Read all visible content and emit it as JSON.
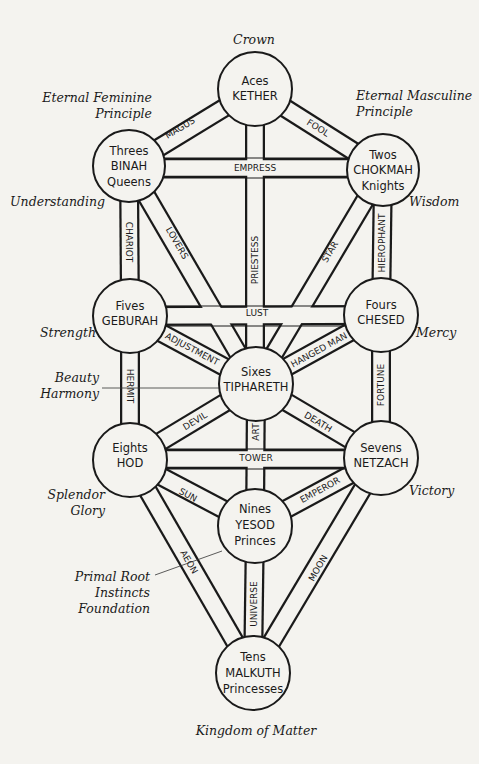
{
  "title_top": "Crown",
  "title_bottom": "Kingdom of Matter",
  "sephiroth": {
    "kether": {
      "line1": "Aces",
      "line2": "KETHER"
    },
    "chokmah": {
      "line1": "Twos",
      "line2": "CHOKMAH",
      "line3": "Knights"
    },
    "binah": {
      "line1": "Threes",
      "line2": "BINAH",
      "line3": "Queens"
    },
    "chesed": {
      "line1": "Fours",
      "line2": "CHESED"
    },
    "geburah": {
      "line1": "Fives",
      "line2": "GEBURAH"
    },
    "tiphareth": {
      "line1": "Sixes",
      "line2": "TIPHARETH"
    },
    "netzach": {
      "line1": "Sevens",
      "line2": "NETZACH"
    },
    "hod": {
      "line1": "Eights",
      "line2": "HOD"
    },
    "yesod": {
      "line1": "Nines",
      "line2": "YESOD",
      "line3": "Princes"
    },
    "malkuth": {
      "line1": "Tens",
      "line2": "MALKUTH",
      "line3": "Princesses"
    }
  },
  "paths": {
    "magus": "MAGUS",
    "fool": "FOOL",
    "empress": "EMPRESS",
    "priestess": "PRIESTESS",
    "chariot": "CHARIOT",
    "lovers": "LOVERS",
    "star": "STAR",
    "hierophant": "HIEROPHANT",
    "lust": "LUST",
    "adjustment": "ADJUSTMENT",
    "hanged_man": "HANGED MAN",
    "hermit": "HERMIT",
    "fortune": "FORTUNE",
    "devil": "DEVIL",
    "art": "ART",
    "death": "DEATH",
    "tower": "TOWER",
    "sun": "SUN",
    "emperor": "EMPEROR",
    "aeon": "AEON",
    "universe": "UNIVERSE",
    "moon": "MOON"
  },
  "annotations": {
    "eternal_feminine_1": "Eternal Feminine",
    "eternal_feminine_2": "Principle",
    "eternal_masculine_1": "Eternal Masculine",
    "eternal_masculine_2": "Principle",
    "understanding": "Understanding",
    "wisdom": "Wisdom",
    "strength": "Strength",
    "mercy": "Mercy",
    "beauty_1": "Beauty",
    "beauty_2": "Harmony",
    "splendor_1": "Splendor",
    "splendor_2": "Glory",
    "victory": "Victory",
    "primal_1": "Primal Root",
    "primal_2": "Instincts",
    "primal_3": "Foundation"
  },
  "colors": {
    "ink": "#1a1a1a",
    "paper": "#f4f3ef"
  }
}
